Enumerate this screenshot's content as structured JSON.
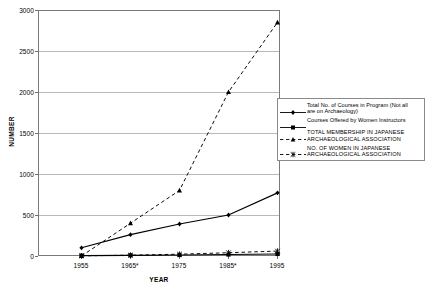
{
  "chart_data": {
    "type": "line",
    "title": "",
    "xlabel": "YEAR",
    "ylabel": "NUMBER",
    "x": [
      1955,
      1965,
      1975,
      1985,
      1995
    ],
    "categories": [
      "1955",
      "1965*",
      "1975",
      "1985*",
      "1995"
    ],
    "ylim": [
      0,
      3000
    ],
    "yticks": [
      0,
      500,
      1000,
      1500,
      2000,
      2500,
      3000
    ],
    "ytick_labels": [
      "0",
      "500",
      "1000",
      "1500",
      "2000",
      "2500",
      "3000"
    ],
    "grid": "horizontal",
    "legend_position": "right",
    "series": [
      {
        "name": "Total No. of Courses in Program (Not all are on Archaeology)",
        "marker": "diamond",
        "line": "solid",
        "color": "#000000",
        "values": [
          100,
          260,
          390,
          500,
          770
        ]
      },
      {
        "name": "Courses Offered by Women Instructors",
        "marker": "square",
        "line": "solid",
        "color": "#000000",
        "values": [
          5,
          8,
          12,
          18,
          25
        ]
      },
      {
        "name": "TOTAL MEMBERSHIP IN JAPANESE ARCHAEOLOGICAL ASSOCIATION",
        "marker": "triangle",
        "line": "dashed",
        "color": "#000000",
        "values": [
          0,
          400,
          800,
          2000,
          2850
        ]
      },
      {
        "name": "NO. OF WOMEN IN JAPANESE ARCHAEOLOGICAL ASSOCIATION",
        "marker": "asterisk",
        "line": "dashed",
        "color": "#000000",
        "values": [
          2,
          10,
          22,
          40,
          60
        ]
      }
    ]
  },
  "legend": {
    "entries": [
      {
        "line1": "Total No. of Courses in Program (Not all",
        "line2": "are on Archaeology)"
      },
      {
        "line1": "Courses Offered by Women Instructors",
        "line2": ""
      },
      {
        "line1": "TOTAL MEMBERSHIP IN JAPANESE",
        "line2": "ARCHAEOLOGICAL ASSOCIATION"
      },
      {
        "line1": "NO. OF WOMEN IN JAPANESE",
        "line2": "ARCHAEOLOGICAL ASSOCIATION"
      }
    ]
  },
  "axes": {
    "y_label": "NUMBER",
    "x_label": "YEAR",
    "y_ticks": [
      "3000",
      "2500",
      "2000",
      "1500",
      "1000",
      "500",
      "0"
    ],
    "x_ticks": [
      "1955",
      "1965*",
      "1975",
      "1985*",
      "1995"
    ]
  },
  "colors": {
    "ink": "#000000",
    "grid": "#b9b9b9",
    "frame": "#7a7a7a",
    "background": "#ffffff"
  }
}
